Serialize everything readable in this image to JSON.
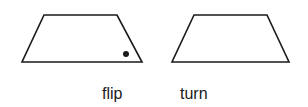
{
  "figure": {
    "shapes": [
      {
        "name": "flip",
        "type": "trapezoid",
        "points": "44,15 117,15 142,62 22,62",
        "dot": {
          "cx": 126,
          "cy": 54,
          "r": 3
        }
      },
      {
        "name": "turn",
        "type": "trapezoid",
        "points": "194,15 267,15 289,62 172,62"
      }
    ],
    "labels": {
      "flip": "flip",
      "turn": "turn"
    },
    "stroke_color": "#1a1a1a",
    "fill_color": "#ffffff"
  }
}
